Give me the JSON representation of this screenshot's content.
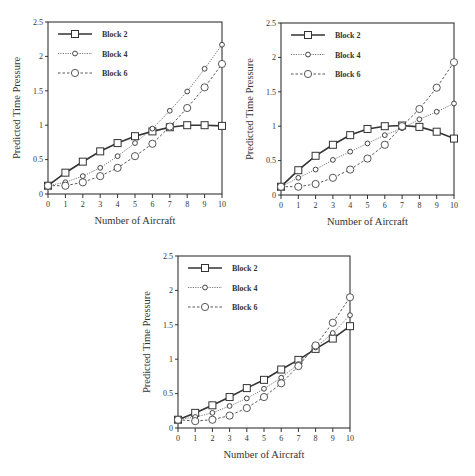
{
  "chart_data": [
    {
      "type": "line",
      "panel": "top-left",
      "title": "",
      "xlabel": "Number of Aircraft",
      "ylabel": "Predicted Time Pressure",
      "x": [
        0,
        1,
        2,
        3,
        4,
        5,
        6,
        7,
        8,
        9,
        10
      ],
      "xticks": [
        "0",
        "1",
        "2",
        "3",
        "4",
        "5",
        "6",
        "7",
        "8",
        "9",
        "10"
      ],
      "yticks": [
        "0",
        "0.5",
        "1",
        "1.5",
        "2",
        "2.5"
      ],
      "xlim": [
        0,
        10
      ],
      "ylim": [
        0,
        2.5
      ],
      "grid": false,
      "legend_position": "upper-left",
      "series": [
        {
          "name": "Block 2",
          "marker": "square",
          "line": "solid-thick",
          "values": [
            0.12,
            0.31,
            0.47,
            0.62,
            0.74,
            0.84,
            0.91,
            0.97,
            1.0,
            1.0,
            0.99
          ]
        },
        {
          "name": "Block 4",
          "marker": "small-circle",
          "line": "dotted-thin",
          "values": [
            0.12,
            0.17,
            0.26,
            0.38,
            0.55,
            0.74,
            0.95,
            1.21,
            1.49,
            1.82,
            2.17
          ]
        },
        {
          "name": "Block 6",
          "marker": "circle",
          "line": "dashed",
          "values": [
            0.12,
            0.12,
            0.17,
            0.26,
            0.38,
            0.55,
            0.73,
            0.98,
            1.25,
            1.55,
            1.89
          ]
        }
      ]
    },
    {
      "type": "line",
      "panel": "top-right",
      "title": "",
      "xlabel": "Number of Aircraft",
      "ylabel": "Predicted Time Pressure",
      "x": [
        0,
        1,
        2,
        3,
        4,
        5,
        6,
        7,
        8,
        9,
        10
      ],
      "xticks": [
        "0",
        "1",
        "2",
        "3",
        "4",
        "5",
        "6",
        "7",
        "8",
        "9",
        "10"
      ],
      "yticks": [
        "0",
        "0.5",
        "1",
        "1.5",
        "2",
        "2.5"
      ],
      "xlim": [
        0,
        10
      ],
      "ylim": [
        0,
        2.5
      ],
      "grid": false,
      "legend_position": "upper-left",
      "series": [
        {
          "name": "Block 2",
          "marker": "square",
          "line": "solid-thick",
          "values": [
            0.12,
            0.36,
            0.57,
            0.73,
            0.87,
            0.96,
            1.0,
            1.01,
            0.99,
            0.92,
            0.82
          ]
        },
        {
          "name": "Block 4",
          "marker": "small-circle",
          "line": "dotted-thin",
          "values": [
            0.12,
            0.25,
            0.37,
            0.51,
            0.63,
            0.75,
            0.87,
            0.97,
            1.1,
            1.21,
            1.33
          ]
        },
        {
          "name": "Block 6",
          "marker": "circle",
          "line": "dashed",
          "values": [
            0.12,
            0.12,
            0.16,
            0.25,
            0.37,
            0.53,
            0.73,
            1.0,
            1.25,
            1.56,
            1.93
          ]
        }
      ]
    },
    {
      "type": "line",
      "panel": "bottom",
      "title": "",
      "xlabel": "Number of Aircraft",
      "ylabel": "Predicted Time Pressure",
      "x": [
        0,
        1,
        2,
        3,
        4,
        5,
        6,
        7,
        8,
        9,
        10
      ],
      "xticks": [
        "0",
        "1",
        "2",
        "3",
        "4",
        "5",
        "6",
        "7",
        "8",
        "9",
        "10"
      ],
      "yticks": [
        "0",
        "0.5",
        "1",
        "1.5",
        "2",
        "2.5"
      ],
      "xlim": [
        0,
        10
      ],
      "ylim": [
        0,
        2.5
      ],
      "grid": false,
      "legend_position": "upper-left",
      "series": [
        {
          "name": "Block 2",
          "marker": "square",
          "line": "solid-thick",
          "values": [
            0.12,
            0.22,
            0.33,
            0.45,
            0.58,
            0.7,
            0.85,
            0.99,
            1.15,
            1.3,
            1.48
          ]
        },
        {
          "name": "Block 4",
          "marker": "small-circle",
          "line": "dotted-thin",
          "values": [
            0.12,
            0.16,
            0.22,
            0.32,
            0.43,
            0.57,
            0.73,
            0.93,
            1.17,
            1.38,
            1.64
          ]
        },
        {
          "name": "Block 6",
          "marker": "circle",
          "line": "dashed",
          "values": [
            0.12,
            0.1,
            0.12,
            0.18,
            0.29,
            0.45,
            0.65,
            0.9,
            1.2,
            1.53,
            1.9
          ]
        }
      ]
    }
  ],
  "panels": [
    {
      "ylabel": "Predicted Time Pressure",
      "xlabel": "Number of Aircraft",
      "legend": [
        "Block 2",
        "Block 4",
        "Block 6"
      ]
    },
    {
      "ylabel": "Predicted Time Pressure",
      "xlabel": "Number of Aircraft",
      "legend": [
        "Block 2",
        "Block 4",
        "Block 6"
      ]
    },
    {
      "ylabel": "Predicted Time Pressure",
      "xlabel": "Number of Aircraft",
      "legend": [
        "Block 2",
        "Block 4",
        "Block 6"
      ]
    }
  ]
}
